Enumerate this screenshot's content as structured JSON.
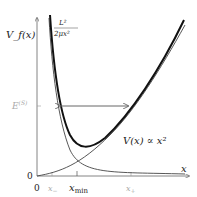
{
  "diagram": {
    "y_axis_label": "V_f(x)",
    "x_axis_label": "x",
    "energy_label": "E",
    "energy_superscript": "(S)",
    "origin_y_label": "0",
    "origin_x_label": "0",
    "tick_labels": {
      "x_minus": "x",
      "x_minus_sub": "−",
      "x_min": "x",
      "x_min_sub": "min",
      "x_plus": "x",
      "x_plus_sub": "+"
    },
    "centrifugal_term": {
      "numerator": "L²",
      "denominator": "2μx²"
    },
    "potential_label": "V(x) ∝ x²",
    "colors": {
      "thick_curve": "#111111",
      "thin_curves": "#444444",
      "axes": "#555555",
      "arrow": "#666666",
      "faint_labels": "#aaaaaa"
    }
  }
}
